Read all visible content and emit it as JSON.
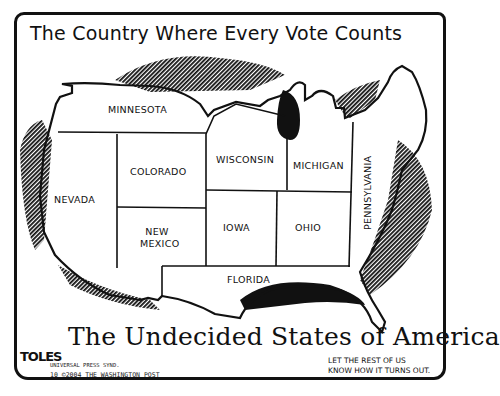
{
  "cartoon": {
    "title": "The Country Where Every Vote Counts",
    "caption": "The Undecided States of America",
    "states": [
      {
        "name": "MINNESOTA"
      },
      {
        "name": "NEVADA"
      },
      {
        "name": "COLORADO"
      },
      {
        "name": "NEW MEXICO"
      },
      {
        "name": "WISCONSIN"
      },
      {
        "name": "MICHIGAN"
      },
      {
        "name": "IOWA"
      },
      {
        "name": "OHIO"
      },
      {
        "name": "PENNSYLVANIA"
      },
      {
        "name": "FLORIDA"
      }
    ],
    "signature": "TOLES",
    "credit_line_1": "UNIVERSAL PRESS SYND.",
    "credit_line_2": "10 ©2004 THE WASHINGTON POST",
    "footnote": "LET THE REST OF US\nKNOW HOW IT TURNS OUT."
  }
}
